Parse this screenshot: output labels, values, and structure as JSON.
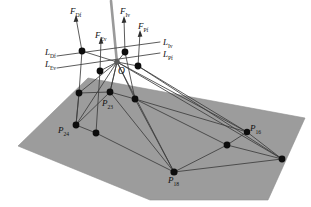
{
  "figure": {
    "kind": "3d-force-vector-diagram",
    "colors": {
      "background": "#ffffff",
      "ground_plane": "#9c9c9c",
      "ground_plane_edge": "#8a8a8a",
      "line": "#3a3a3a",
      "pole": "#9a9a9a",
      "node": "#101010",
      "label": "#111111"
    }
  },
  "labels": {
    "forces": [
      {
        "name": "F_Df",
        "base": "F",
        "sub": "Df",
        "x": 70,
        "y": 7
      },
      {
        "name": "F_Ev",
        "base": "F",
        "sub": "Ev",
        "x": 95,
        "y": 31
      },
      {
        "name": "F_Iv",
        "base": "F",
        "sub": "Iv",
        "x": 120,
        "y": 7
      },
      {
        "name": "F_Pf",
        "base": "F",
        "sub": "Pf",
        "x": 138,
        "y": 22
      }
    ],
    "lines": [
      {
        "name": "L_Iv",
        "base": "L",
        "sub": "Iv",
        "x": 163,
        "y": 42
      },
      {
        "name": "L_Pf",
        "base": "L",
        "sub": "Pf",
        "x": 163,
        "y": 53
      },
      {
        "name": "L_Df",
        "base": "L",
        "sub": "Df",
        "x": 50,
        "y": 50
      },
      {
        "name": "L_Ev",
        "base": "L",
        "sub": "Ev",
        "x": 50,
        "y": 62
      }
    ],
    "origin": {
      "name": "O",
      "base": "O",
      "sub": "",
      "x": 117,
      "y": 66
    },
    "points": [
      {
        "name": "P_24",
        "base": "P",
        "sub": "24",
        "x": 61,
        "y": 126
      },
      {
        "name": "P_23",
        "base": "P",
        "sub": "23",
        "x": 104,
        "y": 99
      },
      {
        "name": "P_18",
        "base": "P",
        "sub": "18",
        "x": 170,
        "y": 178
      },
      {
        "name": "P_16",
        "base": "P",
        "sub": "16",
        "x": 250,
        "y": 125
      }
    ]
  },
  "geometry": {
    "ground_plane_polygon": "18,146 88,78 305,118 268,200 150,200",
    "apex": {
      "x": 117,
      "y": 62
    },
    "pole_top": {
      "x": 111,
      "y": 1
    },
    "nodes": [
      {
        "name": "node-F-Df-top",
        "x": 82,
        "y": 51
      },
      {
        "name": "node-F-Ev-top",
        "x": 100,
        "y": 71
      },
      {
        "name": "node-F-Iv-top",
        "x": 125,
        "y": 52
      },
      {
        "name": "node-F-Pf-top",
        "x": 138,
        "y": 66
      },
      {
        "name": "node-apex-O",
        "x": 117,
        "y": 62
      },
      {
        "name": "node-left-mid",
        "x": 79,
        "y": 93
      },
      {
        "name": "node-P23",
        "x": 110,
        "y": 92
      },
      {
        "name": "node-right-mid",
        "x": 135,
        "y": 99
      },
      {
        "name": "node-P24",
        "x": 76,
        "y": 125
      },
      {
        "name": "node-lower-left",
        "x": 96,
        "y": 133
      },
      {
        "name": "node-P18",
        "x": 174,
        "y": 172
      },
      {
        "name": "node-mid-right",
        "x": 227,
        "y": 145
      },
      {
        "name": "node-P16",
        "x": 247,
        "y": 132
      },
      {
        "name": "node-far-right",
        "x": 282,
        "y": 159
      }
    ]
  }
}
